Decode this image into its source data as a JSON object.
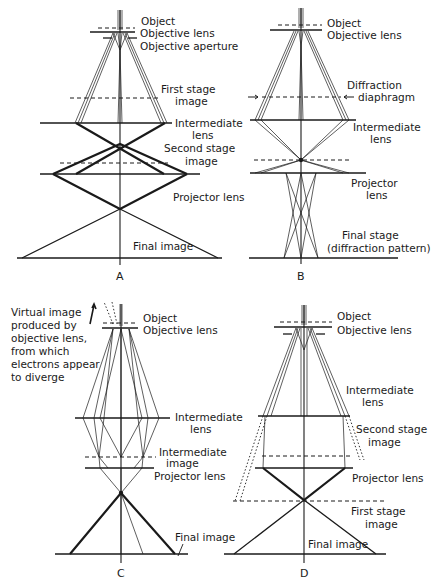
{
  "figure": {
    "type": "electron-microscope ray diagrams",
    "panels": [
      {
        "id": "A",
        "label": "A",
        "annotations": {
          "object": "Object",
          "objective_lens": "Objective lens",
          "objective_aperture": "Objective aperture",
          "first_stage_1": "First stage",
          "first_stage_2": "image",
          "intermediate_1": "Intermediate",
          "intermediate_2": "lens",
          "second_stage_1": "Second stage",
          "second_stage_2": "image",
          "projector": "Projector lens",
          "final": "Final image"
        }
      },
      {
        "id": "B",
        "label": "B",
        "annotations": {
          "object": "Object",
          "objective_lens": "Objective lens",
          "diffraction_1": "Diffraction",
          "diffraction_2": "diaphragm",
          "intermediate_1": "Intermediate",
          "intermediate_2": "lens",
          "projector_1": "Projector",
          "projector_2": "lens",
          "final_1": "Final stage",
          "final_2": "(diffraction pattern)"
        }
      },
      {
        "id": "C",
        "label": "C",
        "annotations": {
          "virtual_1": "Virtual image",
          "virtual_2": "produced by",
          "virtual_3": "objective lens,",
          "virtual_4": "from which",
          "virtual_5": "electrons appear",
          "virtual_6": "to diverge",
          "object": "Object",
          "objective_lens": "Objective lens",
          "intermediate_lens": "Intermediate",
          "intermediate_lens_2": "lens",
          "intermediate_image_1": "Intermediate",
          "intermediate_image_2": "image",
          "projector": "Projector lens",
          "final": "Final image"
        }
      },
      {
        "id": "D",
        "label": "D",
        "annotations": {
          "object": "Object",
          "objective_lens": "Objective lens",
          "intermediate_1": "Intermediate",
          "intermediate_2": "lens",
          "second_stage_1": "Second stage",
          "second_stage_2": "image",
          "projector": "Projector lens",
          "first_stage_1": "First stage",
          "first_stage_2": "image",
          "final": "Final image"
        }
      }
    ]
  }
}
